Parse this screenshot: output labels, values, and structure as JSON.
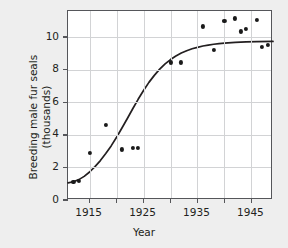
{
  "chart_data": {
    "type": "scatter",
    "title": "",
    "xlabel": "Year",
    "ylabel": "Breeding male fur seals (thousands)",
    "ylabel_line1": "Breeding male fur seals",
    "ylabel_line2": "(thousands)",
    "xlim": [
      1911,
      1949
    ],
    "ylim": [
      0,
      11.6
    ],
    "xticks": [
      1915,
      1925,
      1935,
      1945
    ],
    "xtick_labels": [
      "1915",
      "1925",
      "1935",
      "1945"
    ],
    "xminorticks": [
      1920,
      1930,
      1940
    ],
    "yticks": [
      0,
      2,
      4,
      6,
      8,
      10
    ],
    "ytick_labels": [
      "0",
      "2",
      "4",
      "6",
      "8",
      "10"
    ],
    "grid": true,
    "legend": "none",
    "points": [
      {
        "x": 1912,
        "y": 1.1
      },
      {
        "x": 1913,
        "y": 1.15
      },
      {
        "x": 1915,
        "y": 2.9
      },
      {
        "x": 1918,
        "y": 4.6
      },
      {
        "x": 1921,
        "y": 3.1
      },
      {
        "x": 1923,
        "y": 3.2
      },
      {
        "x": 1924,
        "y": 3.2
      },
      {
        "x": 1930,
        "y": 8.45
      },
      {
        "x": 1932,
        "y": 8.45
      },
      {
        "x": 1936,
        "y": 10.65
      },
      {
        "x": 1938,
        "y": 9.2
      },
      {
        "x": 1940,
        "y": 11.0
      },
      {
        "x": 1942,
        "y": 11.15
      },
      {
        "x": 1943,
        "y": 10.35
      },
      {
        "x": 1944,
        "y": 10.5
      },
      {
        "x": 1946,
        "y": 11.05
      },
      {
        "x": 1947,
        "y": 9.4
      },
      {
        "x": 1948,
        "y": 9.5
      }
    ],
    "fit_curve": {
      "name": "logistic fit",
      "description": "sigmoid growth curve through the data",
      "points": [
        {
          "x": 1911.0,
          "y": 1.05
        },
        {
          "x": 1912.0,
          "y": 1.12
        },
        {
          "x": 1913.0,
          "y": 1.25
        },
        {
          "x": 1914.0,
          "y": 1.45
        },
        {
          "x": 1915.0,
          "y": 1.72
        },
        {
          "x": 1916.0,
          "y": 2.05
        },
        {
          "x": 1917.0,
          "y": 2.42
        },
        {
          "x": 1918.0,
          "y": 2.85
        },
        {
          "x": 1919.0,
          "y": 3.32
        },
        {
          "x": 1920.0,
          "y": 3.85
        },
        {
          "x": 1921.0,
          "y": 4.42
        },
        {
          "x": 1922.0,
          "y": 5.0
        },
        {
          "x": 1923.0,
          "y": 5.6
        },
        {
          "x": 1924.0,
          "y": 6.18
        },
        {
          "x": 1925.0,
          "y": 6.72
        },
        {
          "x": 1926.0,
          "y": 7.22
        },
        {
          "x": 1927.0,
          "y": 7.65
        },
        {
          "x": 1928.0,
          "y": 8.03
        },
        {
          "x": 1929.0,
          "y": 8.35
        },
        {
          "x": 1930.0,
          "y": 8.62
        },
        {
          "x": 1931.0,
          "y": 8.84
        },
        {
          "x": 1932.0,
          "y": 9.02
        },
        {
          "x": 1933.0,
          "y": 9.16
        },
        {
          "x": 1934.0,
          "y": 9.28
        },
        {
          "x": 1935.0,
          "y": 9.37
        },
        {
          "x": 1936.0,
          "y": 9.45
        },
        {
          "x": 1937.0,
          "y": 9.51
        },
        {
          "x": 1938.0,
          "y": 9.56
        },
        {
          "x": 1939.0,
          "y": 9.6
        },
        {
          "x": 1940.0,
          "y": 9.63
        },
        {
          "x": 1942.0,
          "y": 9.67
        },
        {
          "x": 1944.0,
          "y": 9.7
        },
        {
          "x": 1946.0,
          "y": 9.72
        },
        {
          "x": 1949.0,
          "y": 9.73
        }
      ]
    },
    "colors": {
      "background": "#eeeeee",
      "plot_background": "#ffffff",
      "axis": "#55565a",
      "grid": "#d2d3d5",
      "marker": "#1a1a1a",
      "curve": "#231f20"
    }
  }
}
